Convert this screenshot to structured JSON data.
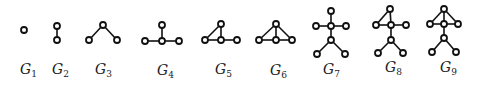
{
  "figure": {
    "node_radius": 3,
    "graphs": [
      {
        "id": "G1",
        "label": "G",
        "subscript": "1",
        "label_pos": [
          20,
          74
        ],
        "nodes": [
          [
            24,
            30
          ]
        ],
        "edges": []
      },
      {
        "id": "G2",
        "label": "G",
        "subscript": "2",
        "label_pos": [
          52,
          74
        ],
        "nodes": [
          [
            57,
            26
          ],
          [
            57,
            40
          ]
        ],
        "edges": [
          [
            0,
            1
          ]
        ]
      },
      {
        "id": "G3",
        "label": "G",
        "subscript": "3",
        "label_pos": [
          95,
          74
        ],
        "nodes": [
          [
            103,
            25
          ],
          [
            89,
            40
          ],
          [
            117,
            40
          ]
        ],
        "edges": [
          [
            0,
            1
          ],
          [
            0,
            2
          ]
        ]
      },
      {
        "id": "G4",
        "label": "G",
        "subscript": "4",
        "label_pos": [
          157,
          75
        ],
        "nodes": [
          [
            162,
            25
          ],
          [
            145,
            41
          ],
          [
            162,
            41
          ],
          [
            179,
            41
          ]
        ],
        "edges": [
          [
            0,
            2
          ],
          [
            1,
            2
          ],
          [
            2,
            3
          ]
        ]
      },
      {
        "id": "G5",
        "label": "G",
        "subscript": "5",
        "label_pos": [
          215,
          74
        ],
        "nodes": [
          [
            221,
            24
          ],
          [
            205,
            40
          ],
          [
            221,
            40
          ],
          [
            237,
            40
          ]
        ],
        "edges": [
          [
            1,
            0
          ],
          [
            0,
            2
          ],
          [
            1,
            2
          ],
          [
            2,
            3
          ]
        ]
      },
      {
        "id": "G6",
        "label": "G",
        "subscript": "6",
        "label_pos": [
          270,
          75
        ],
        "nodes": [
          [
            276,
            24
          ],
          [
            259,
            40
          ],
          [
            276,
            40
          ],
          [
            292,
            40
          ]
        ],
        "edges": [
          [
            1,
            0
          ],
          [
            0,
            2
          ],
          [
            0,
            3
          ],
          [
            1,
            2
          ],
          [
            2,
            3
          ]
        ]
      },
      {
        "id": "G7",
        "label": "G",
        "subscript": "7",
        "label_pos": [
          323,
          74
        ],
        "nodes": [
          [
            331,
            11
          ],
          [
            316,
            26
          ],
          [
            331,
            26
          ],
          [
            346,
            26
          ],
          [
            331,
            40
          ],
          [
            317,
            54
          ],
          [
            345,
            54
          ]
        ],
        "edges": [
          [
            0,
            2
          ],
          [
            1,
            2
          ],
          [
            2,
            3
          ],
          [
            2,
            4
          ],
          [
            4,
            5
          ],
          [
            4,
            6
          ]
        ]
      },
      {
        "id": "G8",
        "label": "G",
        "subscript": "8",
        "label_pos": [
          385,
          72
        ],
        "nodes": [
          [
            390,
            9
          ],
          [
            376,
            25
          ],
          [
            391,
            25
          ],
          [
            406,
            25
          ],
          [
            391,
            40
          ],
          [
            378,
            53
          ],
          [
            403,
            53
          ]
        ],
        "edges": [
          [
            1,
            0
          ],
          [
            0,
            2
          ],
          [
            1,
            2
          ],
          [
            2,
            3
          ],
          [
            2,
            4
          ],
          [
            4,
            5
          ],
          [
            4,
            6
          ]
        ]
      },
      {
        "id": "G9",
        "label": "G",
        "subscript": "9",
        "label_pos": [
          440,
          72
        ],
        "nodes": [
          [
            444,
            9
          ],
          [
            430,
            24
          ],
          [
            444,
            24
          ],
          [
            458,
            24
          ],
          [
            444,
            38
          ],
          [
            432,
            52
          ],
          [
            456,
            52
          ]
        ],
        "edges": [
          [
            1,
            0
          ],
          [
            0,
            2
          ],
          [
            0,
            3
          ],
          [
            1,
            2
          ],
          [
            2,
            3
          ],
          [
            2,
            4
          ],
          [
            4,
            5
          ],
          [
            4,
            6
          ]
        ]
      }
    ]
  }
}
